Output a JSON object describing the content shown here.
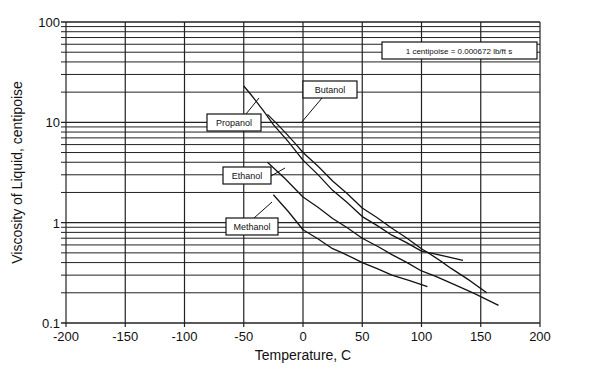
{
  "chart_data": {
    "type": "line",
    "title": "",
    "xlabel": "Temperature, C",
    "ylabel": "Viscosity of Liquid, centipoise",
    "xlim": [
      -200,
      200
    ],
    "ylim": [
      0.1,
      100
    ],
    "yscale": "log",
    "grid": true,
    "x_ticks": [
      "-200",
      "-150",
      "-100",
      "-50",
      "0",
      "50",
      "100",
      "150",
      "200"
    ],
    "y_ticks": [
      "0.1",
      "1",
      "10",
      "100"
    ],
    "annotation": "1 centipoise = 0.000672 lb/ft s",
    "series": [
      {
        "name": "Propanol",
        "x": [
          -50,
          -25,
          0,
          25,
          50,
          75,
          100,
          135
        ],
        "y": [
          23,
          9.5,
          4.2,
          2.1,
          1.15,
          0.75,
          0.52,
          0.42
        ]
      },
      {
        "name": "Butanol",
        "x": [
          -30,
          0,
          25,
          50,
          75,
          100,
          125,
          155
        ],
        "y": [
          12,
          5.0,
          2.6,
          1.4,
          0.88,
          0.55,
          0.35,
          0.2
        ]
      },
      {
        "name": "Ethanol",
        "x": [
          -30,
          0,
          25,
          50,
          75,
          100,
          125,
          165
        ],
        "y": [
          4.0,
          1.8,
          1.1,
          0.7,
          0.48,
          0.33,
          0.25,
          0.15
        ]
      },
      {
        "name": "Methanol",
        "x": [
          -25,
          0,
          25,
          50,
          75,
          105
        ],
        "y": [
          1.9,
          0.85,
          0.55,
          0.4,
          0.3,
          0.23
        ]
      }
    ]
  }
}
